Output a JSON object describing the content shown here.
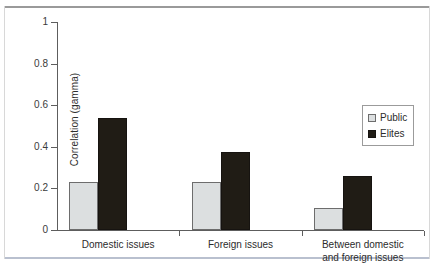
{
  "chart_data": {
    "type": "bar",
    "title": "",
    "xlabel": "",
    "ylabel": "Correlation (gamma)",
    "ylim": [
      0,
      1
    ],
    "yticks": [
      "0",
      "0.2",
      "0.4",
      "0.6",
      "0.8",
      "1"
    ],
    "grid": false,
    "legend_position": "right",
    "categories": [
      "Domestic issues",
      "Foreign issues",
      "Between domestic and foreign issues"
    ],
    "category_lines": [
      [
        "Domestic issues"
      ],
      [
        "Foreign issues"
      ],
      [
        "Between domestic",
        "and foreign issues"
      ]
    ],
    "series": [
      {
        "name": "Public",
        "color": "#dcdfe0",
        "values": [
          0.23,
          0.23,
          0.105
        ]
      },
      {
        "name": "Elites",
        "color": "#201c15",
        "values": [
          0.54,
          0.375,
          0.26
        ]
      }
    ]
  },
  "legend": {
    "items": [
      {
        "label": "Public",
        "swatch": "public-swatch"
      },
      {
        "label": "Elites",
        "swatch": "elites-swatch"
      }
    ]
  }
}
